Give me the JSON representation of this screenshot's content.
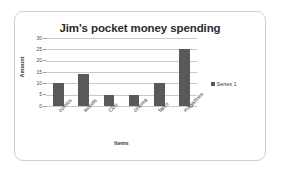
{
  "chart_data": {
    "type": "bar",
    "title": "Jim's pocket money spending",
    "xlabel": "Items",
    "ylabel": "Amount",
    "categories": [
      "comics",
      "sweets",
      "CDs",
      "cinema",
      "fares",
      "magazines"
    ],
    "values": [
      10,
      14,
      5,
      5,
      10,
      25
    ],
    "series": [
      {
        "name": "Series 1",
        "values": [
          10,
          14,
          5,
          5,
          10,
          25
        ]
      }
    ],
    "ylim": [
      0,
      30
    ],
    "y_ticks": [
      30,
      25,
      20,
      15,
      10,
      5,
      0
    ],
    "grid": true,
    "legend_position": "right",
    "legend_entries": [
      "Series 1"
    ],
    "colors": {
      "bar": "#595959",
      "gridline": "#c9c9c9",
      "axis": "#9a9a9a",
      "title_text": "#2b2b2b",
      "label_text": "#3a3a3a",
      "frame_border": "#cfcfcf",
      "background": "#ffffff"
    }
  }
}
